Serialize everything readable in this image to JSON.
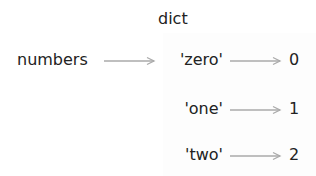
{
  "diagram": {
    "title": "dict",
    "variable": "numbers",
    "entries": [
      {
        "key": "'zero'",
        "value": "0"
      },
      {
        "key": "'one'",
        "value": "1"
      },
      {
        "key": "'two'",
        "value": "2"
      }
    ],
    "colors": {
      "text": "#222222",
      "arrow": "#aaaaaa",
      "box": "#fdfdfd"
    }
  }
}
